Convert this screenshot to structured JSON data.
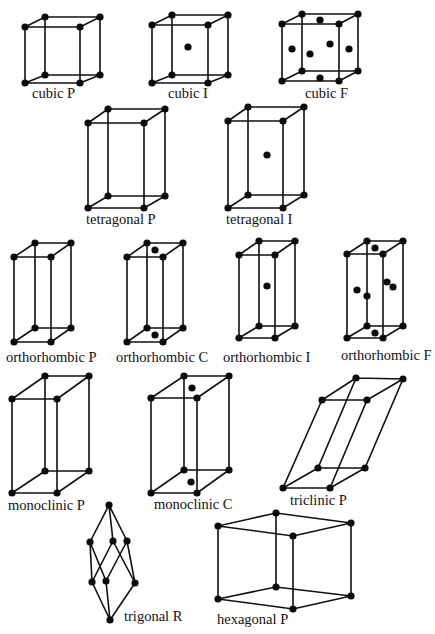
{
  "figure": {
    "lattices": [
      {
        "id": "cubic-p",
        "label": "cubic P",
        "system": "cubic",
        "centering": "P"
      },
      {
        "id": "cubic-i",
        "label": "cubic I",
        "system": "cubic",
        "centering": "I"
      },
      {
        "id": "cubic-f",
        "label": "cubic F",
        "system": "cubic",
        "centering": "F"
      },
      {
        "id": "tetragonal-p",
        "label": "tetragonal P",
        "system": "tetragonal",
        "centering": "P"
      },
      {
        "id": "tetragonal-i",
        "label": "tetragonal I",
        "system": "tetragonal",
        "centering": "I"
      },
      {
        "id": "orthorhombic-p",
        "label": "orthorhombic P",
        "system": "orthorhombic",
        "centering": "P"
      },
      {
        "id": "orthorhombic-c",
        "label": "orthorhombic C",
        "system": "orthorhombic",
        "centering": "C"
      },
      {
        "id": "orthorhombic-i",
        "label": "orthorhombic I",
        "system": "orthorhombic",
        "centering": "I"
      },
      {
        "id": "orthorhombic-f",
        "label": "orthorhombic F",
        "system": "orthorhombic",
        "centering": "F"
      },
      {
        "id": "monoclinic-p",
        "label": "monoclinic P",
        "system": "monoclinic",
        "centering": "P"
      },
      {
        "id": "monoclinic-c",
        "label": "monoclinic C",
        "system": "monoclinic",
        "centering": "C"
      },
      {
        "id": "triclinic-p",
        "label": "triclinic P",
        "system": "triclinic",
        "centering": "P"
      },
      {
        "id": "trigonal-r",
        "label": "trigonal R",
        "system": "trigonal",
        "centering": "R"
      },
      {
        "id": "hexagonal-p",
        "label": "hexagonal P",
        "system": "hexagonal",
        "centering": "P"
      }
    ]
  },
  "colors": {
    "background": "#ffffff",
    "lines": "#111111",
    "atoms": "#0a0a0a"
  }
}
